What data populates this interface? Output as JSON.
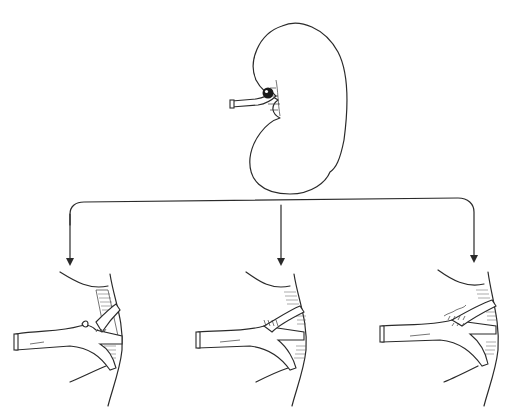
{
  "figure": {
    "type": "medical-illustration",
    "top_panel": {
      "label": "kidney-with-aneurysm"
    },
    "arrows": {
      "count": 3,
      "direction": "down"
    },
    "bottom_panels": [
      {
        "label": "repair-option-1",
        "description": "aneurysm at branch point with small sutured stump"
      },
      {
        "label": "repair-option-2",
        "description": "branch reimplanted with suture line"
      },
      {
        "label": "repair-option-3",
        "description": "patch repair with running suture at branch"
      }
    ],
    "colors": {
      "ink": "#2a2a2a",
      "background": "#ffffff",
      "aneurysm_fill": "#1a1a1a"
    }
  },
  "page_header": {
    "visible_text": ""
  }
}
